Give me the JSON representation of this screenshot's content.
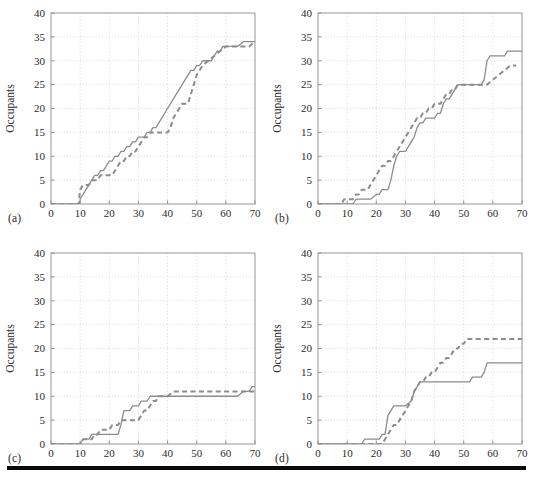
{
  "figure": {
    "panels": [
      {
        "id": "a",
        "caption": "(a)"
      },
      {
        "id": "b",
        "caption": "(b)"
      },
      {
        "id": "c",
        "caption": "(c)"
      },
      {
        "id": "d",
        "caption": "(d)"
      }
    ],
    "rule_color": "#0a0a0a"
  },
  "axes": {
    "xlabel": "Time (s)",
    "ylabel": "Occupants",
    "xticks": [
      "0",
      "10",
      "20",
      "30",
      "40",
      "50",
      "60",
      "70"
    ],
    "yticks": [
      "0",
      "5",
      "10",
      "15",
      "20",
      "25",
      "30",
      "35",
      "40"
    ],
    "xlim": [
      0,
      70
    ],
    "ylim": [
      0,
      40
    ],
    "grid": true,
    "grid_color": "#bdbdbd",
    "axis_color": "#8a8a8a",
    "line_color": "#8c8c8c"
  },
  "chart_data": [
    {
      "type": "line",
      "panel": "a",
      "title": "(a)",
      "xlabel": "Time (s)",
      "ylabel": "Occupants",
      "xlim": [
        0,
        70
      ],
      "ylim": [
        0,
        40
      ],
      "xticks": [
        0,
        10,
        20,
        30,
        40,
        50,
        60,
        70
      ],
      "yticks": [
        0,
        5,
        10,
        15,
        20,
        25,
        30,
        35,
        40
      ],
      "grid": true,
      "legend": "none",
      "series": [
        {
          "name": "solid",
          "style": "solid",
          "color": "#8c8c8c",
          "x": [
            0,
            9.8,
            10,
            11,
            12,
            13,
            14,
            15,
            16,
            17,
            18,
            19,
            20,
            21,
            22,
            23,
            24,
            25,
            26,
            27,
            28,
            29,
            30,
            31,
            32,
            33,
            34,
            35,
            36,
            37,
            38,
            39,
            40,
            41,
            42,
            43,
            44,
            45,
            46,
            47,
            48,
            49,
            50,
            51,
            52,
            53,
            54,
            55,
            56,
            57,
            58,
            59,
            60,
            62,
            64,
            66,
            68,
            70
          ],
          "y": [
            0,
            0,
            1,
            2,
            3,
            4,
            5,
            6,
            6,
            7,
            7,
            8,
            9,
            9,
            10,
            10,
            11,
            11,
            12,
            12,
            13,
            13,
            14,
            14,
            14,
            15,
            15,
            16,
            16,
            17,
            18,
            19,
            20,
            21,
            22,
            23,
            24,
            25,
            26,
            27,
            28,
            28,
            29,
            29,
            30,
            30,
            30,
            30,
            31,
            32,
            32,
            33,
            33,
            33,
            33,
            34,
            34,
            34
          ]
        },
        {
          "name": "dashed",
          "style": "dashed",
          "color": "#8c8c8c",
          "x": [
            0,
            9.5,
            10,
            11,
            12,
            13,
            14,
            15,
            16,
            17,
            18,
            19,
            20,
            21,
            22,
            23,
            24,
            25,
            26,
            27,
            28,
            29,
            30,
            31,
            32,
            33,
            34,
            35,
            36,
            37,
            38,
            39,
            40,
            41,
            42,
            43,
            44,
            45,
            46,
            47,
            48,
            49,
            50,
            52,
            54,
            56,
            58,
            60,
            62,
            64,
            66,
            68,
            70
          ],
          "y": [
            0,
            0,
            3,
            4,
            4,
            4,
            5,
            5,
            5,
            6,
            6,
            6,
            6,
            6,
            7,
            8,
            9,
            9,
            10,
            10,
            11,
            11,
            12,
            13,
            14,
            14,
            15,
            15,
            15,
            15,
            15,
            15,
            15,
            16,
            18,
            19,
            20,
            21,
            21,
            21,
            23,
            25,
            27,
            29,
            30,
            31,
            32,
            33,
            33,
            33,
            33,
            33,
            34
          ]
        }
      ]
    },
    {
      "type": "line",
      "panel": "b",
      "title": "(b)",
      "xlabel": "Time (s)",
      "ylabel": "Occupants",
      "xlim": [
        0,
        70
      ],
      "ylim": [
        0,
        40
      ],
      "xticks": [
        0,
        10,
        20,
        30,
        40,
        50,
        60,
        70
      ],
      "yticks": [
        0,
        5,
        10,
        15,
        20,
        25,
        30,
        35,
        40
      ],
      "grid": true,
      "legend": "none",
      "series": [
        {
          "name": "solid",
          "style": "solid",
          "color": "#8c8c8c",
          "x": [
            0,
            12,
            13,
            14,
            16,
            18,
            20,
            21,
            22,
            23,
            24,
            25,
            26,
            27,
            28,
            29,
            30,
            31,
            32,
            33,
            34,
            35,
            36,
            37,
            38,
            39,
            40,
            41,
            42,
            43,
            44,
            45,
            46,
            47,
            48,
            50,
            52,
            54,
            56,
            57,
            58,
            59,
            60,
            62,
            64,
            65,
            66,
            68,
            70
          ],
          "y": [
            0,
            0,
            1,
            1,
            1,
            1,
            2,
            2,
            3,
            3,
            3,
            5,
            8,
            10,
            11,
            11,
            11,
            12,
            13,
            14,
            16,
            17,
            17,
            18,
            18,
            18,
            18,
            19,
            19,
            21,
            22,
            22,
            23,
            24,
            25,
            25,
            25,
            25,
            25,
            26,
            30,
            31,
            31,
            31,
            31,
            32,
            32,
            32,
            32
          ]
        },
        {
          "name": "dashed",
          "style": "dashed",
          "color": "#8c8c8c",
          "x": [
            0,
            7,
            8,
            9,
            10,
            11,
            12,
            13,
            14,
            15,
            16,
            17,
            18,
            19,
            20,
            21,
            22,
            23,
            24,
            25,
            26,
            27,
            28,
            29,
            30,
            31,
            32,
            33,
            34,
            35,
            36,
            37,
            38,
            39,
            40,
            41,
            42,
            43,
            44,
            45,
            46,
            47,
            48,
            50,
            52,
            54,
            56,
            58,
            60,
            62,
            64,
            66,
            68
          ],
          "y": [
            0,
            0,
            0,
            1,
            1,
            1,
            1,
            2,
            2,
            3,
            3,
            3,
            4,
            5,
            6,
            7,
            8,
            8,
            9,
            9,
            10,
            11,
            12,
            13,
            14,
            15,
            16,
            17,
            18,
            18,
            19,
            19,
            20,
            20,
            21,
            21,
            21,
            22,
            23,
            23,
            24,
            24,
            25,
            25,
            25,
            25,
            25,
            25,
            26,
            27,
            28,
            29,
            29
          ]
        }
      ]
    },
    {
      "type": "line",
      "panel": "c",
      "title": "(c)",
      "xlabel": "Time (s)",
      "ylabel": "Occupants",
      "xlim": [
        0,
        70
      ],
      "ylim": [
        0,
        40
      ],
      "xticks": [
        0,
        10,
        20,
        30,
        40,
        50,
        60,
        70
      ],
      "yticks": [
        0,
        5,
        10,
        15,
        20,
        25,
        30,
        35,
        40
      ],
      "grid": true,
      "legend": "none",
      "series": [
        {
          "name": "solid",
          "style": "solid",
          "color": "#8c8c8c",
          "x": [
            0,
            10,
            11,
            12,
            13,
            14,
            15,
            17,
            19,
            20,
            21,
            22,
            23,
            24,
            25,
            26,
            27,
            28,
            29,
            30,
            31,
            32,
            33,
            34,
            35,
            36,
            38,
            40,
            45,
            50,
            55,
            60,
            64,
            66,
            67,
            68,
            69,
            70
          ],
          "y": [
            0,
            0,
            1,
            1,
            1,
            2,
            2,
            2,
            2,
            2,
            2,
            2,
            2,
            4,
            7,
            7,
            7,
            8,
            8,
            8,
            9,
            9,
            9,
            10,
            10,
            10,
            10,
            10,
            10,
            10,
            10,
            10,
            10,
            11,
            11,
            11,
            12,
            12
          ]
        },
        {
          "name": "dashed",
          "style": "dashed",
          "color": "#8c8c8c",
          "x": [
            0,
            10,
            11,
            12,
            13,
            14,
            15,
            16,
            17,
            18,
            19,
            20,
            21,
            22,
            23,
            24,
            25,
            26,
            28,
            30,
            31,
            32,
            33,
            34,
            35,
            36,
            37,
            38,
            40,
            42,
            44,
            46,
            50,
            55,
            60,
            65,
            68,
            70
          ],
          "y": [
            0,
            0,
            1,
            1,
            1,
            1,
            2,
            2,
            3,
            3,
            3,
            3,
            4,
            4,
            4,
            5,
            5,
            5,
            5,
            5,
            6,
            7,
            7,
            8,
            9,
            9,
            10,
            10,
            10,
            11,
            11,
            11,
            11,
            11,
            11,
            11,
            11,
            11
          ]
        }
      ]
    },
    {
      "type": "line",
      "panel": "d",
      "title": "(d)",
      "xlabel": "Time (s)",
      "ylabel": "Occupants",
      "xlim": [
        0,
        70
      ],
      "ylim": [
        0,
        40
      ],
      "xticks": [
        0,
        10,
        20,
        30,
        40,
        50,
        60,
        70
      ],
      "yticks": [
        0,
        5,
        10,
        15,
        20,
        25,
        30,
        35,
        40
      ],
      "grid": true,
      "legend": "none",
      "series": [
        {
          "name": "solid",
          "style": "solid",
          "color": "#8c8c8c",
          "x": [
            0,
            15,
            16,
            18,
            20,
            21,
            22,
            23,
            24,
            25,
            26,
            28,
            30,
            32,
            33,
            34,
            35,
            36,
            37,
            38,
            40,
            44,
            48,
            52,
            53,
            54,
            56,
            57,
            58,
            59,
            60,
            64,
            68,
            70
          ],
          "y": [
            0,
            0,
            1,
            1,
            1,
            1,
            2,
            2,
            6,
            7,
            8,
            8,
            8,
            9,
            11,
            12,
            13,
            13,
            13,
            13,
            13,
            13,
            13,
            13,
            14,
            14,
            14,
            15,
            17,
            17,
            17,
            17,
            17,
            17
          ]
        },
        {
          "name": "dashed",
          "style": "dashed",
          "color": "#8c8c8c",
          "x": [
            0,
            21,
            22,
            23,
            24,
            25,
            26,
            27,
            28,
            29,
            30,
            31,
            32,
            33,
            34,
            35,
            36,
            37,
            38,
            39,
            40,
            41,
            42,
            43,
            44,
            45,
            46,
            47,
            48,
            49,
            50,
            51,
            54,
            58,
            62,
            66,
            70
          ],
          "y": [
            0,
            0,
            0,
            1,
            2,
            3,
            4,
            4,
            5,
            6,
            7,
            8,
            9,
            11,
            12,
            13,
            13,
            14,
            14,
            15,
            15,
            16,
            17,
            17,
            18,
            18,
            19,
            20,
            20,
            21,
            21,
            22,
            22,
            22,
            22,
            22,
            22
          ]
        }
      ]
    }
  ]
}
